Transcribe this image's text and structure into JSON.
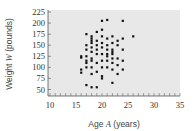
{
  "chart_data": {
    "type": "scatter",
    "title": "",
    "xlabel": "Age A (years)",
    "xlabel_parts": {
      "pre": "Age ",
      "var": "A",
      "post": " (years)"
    },
    "ylabel": "Weight W (pounds)",
    "ylabel_parts": {
      "pre": "Weight ",
      "var": "W",
      "post": " (pounds)"
    },
    "xlim": [
      10,
      35
    ],
    "ylim": [
      50,
      225
    ],
    "xticks": [
      10,
      15,
      20,
      25,
      30,
      35
    ],
    "yticks": [
      50,
      75,
      100,
      125,
      150,
      175,
      200,
      225
    ],
    "grid": false,
    "legend": null,
    "colors": {
      "background": "#e8e8e8",
      "point": "#111111",
      "axis": "#555555"
    },
    "points": [
      [
        16,
        125
      ],
      [
        16,
        122
      ],
      [
        16,
        95
      ],
      [
        16,
        88
      ],
      [
        17,
        175
      ],
      [
        17,
        150
      ],
      [
        17,
        140
      ],
      [
        17,
        125
      ],
      [
        17,
        115
      ],
      [
        17,
        110
      ],
      [
        17,
        100
      ],
      [
        17,
        60
      ],
      [
        18,
        170
      ],
      [
        18,
        165
      ],
      [
        18,
        160
      ],
      [
        18,
        155
      ],
      [
        18,
        145
      ],
      [
        18,
        135
      ],
      [
        18,
        120
      ],
      [
        18,
        115
      ],
      [
        18,
        100
      ],
      [
        18,
        85
      ],
      [
        18,
        55
      ],
      [
        19,
        180
      ],
      [
        19,
        160
      ],
      [
        19,
        150
      ],
      [
        19,
        140
      ],
      [
        19,
        130
      ],
      [
        19,
        110
      ],
      [
        19,
        90
      ],
      [
        19,
        55
      ],
      [
        20,
        205
      ],
      [
        20,
        185
      ],
      [
        20,
        170
      ],
      [
        20,
        155
      ],
      [
        20,
        145
      ],
      [
        20,
        130
      ],
      [
        20,
        115
      ],
      [
        20,
        100
      ],
      [
        20,
        80
      ],
      [
        20,
        75
      ],
      [
        21,
        207
      ],
      [
        21,
        165
      ],
      [
        21,
        150
      ],
      [
        21,
        140
      ],
      [
        21,
        130
      ],
      [
        21,
        125
      ],
      [
        21,
        115
      ],
      [
        21,
        100
      ],
      [
        22,
        170
      ],
      [
        22,
        155
      ],
      [
        22,
        140
      ],
      [
        22,
        135
      ],
      [
        22,
        130
      ],
      [
        22,
        120
      ],
      [
        22,
        110
      ],
      [
        22,
        95
      ],
      [
        22,
        65
      ],
      [
        23,
        160
      ],
      [
        23,
        150
      ],
      [
        23,
        120
      ],
      [
        23,
        105
      ],
      [
        23,
        85
      ],
      [
        24,
        205
      ],
      [
        24,
        165
      ],
      [
        24,
        140
      ],
      [
        24,
        115
      ],
      [
        24,
        95
      ],
      [
        26,
        170
      ]
    ]
  }
}
